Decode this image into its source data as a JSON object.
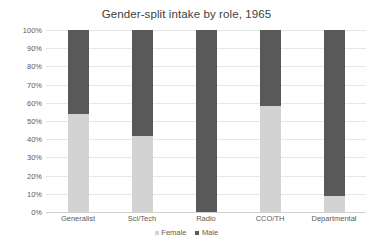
{
  "chart_data": {
    "type": "bar",
    "subtype": "stacked-100-percent",
    "title": "Gender-split intake by role, 1965",
    "xlabel": "",
    "ylabel": "",
    "categories": [
      "Generalist",
      "Sci/Tech",
      "Radio",
      "CCO/TH",
      "Departmental"
    ],
    "series": [
      {
        "name": "Female",
        "color": "#d3d3d3",
        "values": [
          54,
          42,
          0,
          58,
          9
        ]
      },
      {
        "name": "Male",
        "color": "#595959",
        "values": [
          46,
          58,
          100,
          42,
          91
        ]
      }
    ],
    "ylim": [
      0,
      100
    ],
    "ytick_labels": [
      "0%",
      "10%",
      "20%",
      "30%",
      "40%",
      "50%",
      "60%",
      "70%",
      "80%",
      "90%",
      "100%"
    ],
    "ytick_values": [
      0,
      10,
      20,
      30,
      40,
      50,
      60,
      70,
      80,
      90,
      100
    ],
    "grid": true,
    "legend_position": "bottom-center",
    "legend_entries": [
      "Female",
      "Male"
    ]
  },
  "colors": {
    "female": "#d3d3d3",
    "male": "#595959",
    "grid": "#e6e6e6",
    "text": "#5a5a5a",
    "title_text": "#404040",
    "background": "#ffffff"
  }
}
